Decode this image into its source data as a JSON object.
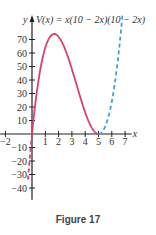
{
  "chart_data": {
    "type": "line",
    "title": "V(x) = x(10 − 2x)(10 − 2x)",
    "xlabel": "x",
    "ylabel": "y",
    "caption": "Figure 17",
    "xlim": [
      -2.5,
      7.8
    ],
    "ylim": [
      -45,
      80
    ],
    "x_ticks": [
      -2,
      1,
      2,
      3,
      4,
      5,
      6,
      7
    ],
    "y_ticks": [
      70,
      60,
      50,
      40,
      30,
      20,
      10,
      -10,
      -20,
      -30,
      -40
    ],
    "grid": false,
    "series": [
      {
        "name": "V(x) on domain 0≤x≤5",
        "style": "solid",
        "color": "#d9416b",
        "x_range": [
          0,
          5
        ],
        "peak": {
          "x": 1.67,
          "y": 74.1
        }
      },
      {
        "name": "V(x) for x<0",
        "style": "dashed",
        "color": "#d9416b",
        "x_range": [
          -0.3,
          0
        ]
      },
      {
        "name": "V(x) for x>5",
        "style": "dashed",
        "color": "#3aa3d9",
        "x_range": [
          5,
          6.8
        ]
      }
    ],
    "function": "x*(10-2*x)*(10-2*x)"
  },
  "layout": {
    "origin_px": [
      32,
      134
    ],
    "x_scale": 13.3,
    "y_scale": 1.35
  }
}
